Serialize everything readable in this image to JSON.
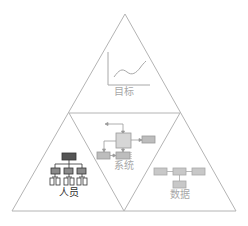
{
  "diagram": {
    "type": "pyramid",
    "colors": {
      "outline": "#b4b4b4",
      "faded_text": "#a8a8a8",
      "dark_text": "#333333",
      "node_gray": "#bdbdbd",
      "node_dark": "#555555",
      "node_mid": "#8a8a8a"
    },
    "sections": {
      "top": {
        "label": "目标",
        "icon": "line-chart-icon"
      },
      "middle": {
        "label": "系统",
        "icon": "system-block-diagram-icon"
      },
      "left": {
        "label": "人员",
        "icon": "org-chart-icon"
      },
      "right": {
        "label": "数据",
        "icon": "data-flow-icon"
      }
    }
  }
}
